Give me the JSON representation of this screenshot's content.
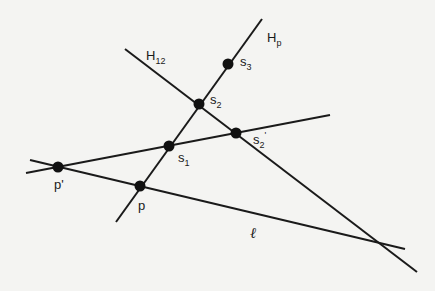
{
  "diagram": {
    "lines": [
      {
        "id": "Hp",
        "label_main": "H",
        "label_sub": "p",
        "x1": 262,
        "y1": 19,
        "x2": 116,
        "y2": 222
      },
      {
        "id": "H12",
        "label_main": "H",
        "label_sub": "12",
        "x1": 125,
        "y1": 49,
        "x2": 417,
        "y2": 272
      },
      {
        "id": "p_prime_line",
        "x1": 26,
        "y1": 173,
        "x2": 330,
        "y2": 115
      },
      {
        "id": "l",
        "label_main": "ℓ",
        "x1": 30,
        "y1": 160,
        "x2": 405,
        "y2": 249
      }
    ],
    "points": [
      {
        "id": "s3",
        "x": 228,
        "y": 64,
        "label_main": "s",
        "label_sub": "3"
      },
      {
        "id": "s2",
        "x": 199,
        "y": 104,
        "label_main": "s",
        "label_sub": "2"
      },
      {
        "id": "s2_prime",
        "x": 236,
        "y": 133,
        "label_main": "s",
        "label_sub": "2",
        "label_prime": "'"
      },
      {
        "id": "s1",
        "x": 169,
        "y": 146,
        "label_main": "s",
        "label_sub": "1"
      },
      {
        "id": "p_prime",
        "x": 58,
        "y": 167,
        "label_main": "p'"
      },
      {
        "id": "p",
        "x": 140,
        "y": 186,
        "label_main": "p"
      }
    ],
    "labels": {
      "Hp": {
        "main": "H",
        "sub": "p"
      },
      "H12": {
        "main": "H",
        "sub": "12"
      },
      "s3": {
        "main": "s",
        "sub": "3"
      },
      "s2": {
        "main": "s",
        "sub": "2"
      },
      "s2_prime": {
        "main": "s",
        "sub": "2",
        "prime": "'"
      },
      "s1": {
        "main": "s",
        "sub": "1"
      },
      "p_prime": "p'",
      "p": "p",
      "l": "ℓ"
    }
  }
}
